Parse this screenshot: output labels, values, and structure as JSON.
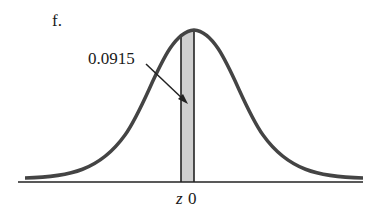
{
  "figure": {
    "part_label": "f.",
    "area_label": "0.0915",
    "axis_labels": {
      "z": "z",
      "zero": "0"
    },
    "colors": {
      "curve": "#444444",
      "shade": "#cfcfcf",
      "line": "#222222"
    }
  }
}
